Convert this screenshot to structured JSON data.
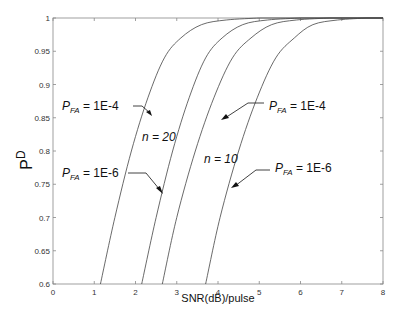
{
  "chart_data": {
    "type": "line",
    "title": "",
    "xlabel": "SNR(dB)/pulse",
    "ylabel": "P_D",
    "xlim": [
      0,
      8
    ],
    "ylim": [
      0.6,
      1
    ],
    "grid": false,
    "x_ticks": [
      "0",
      "1",
      "2",
      "3",
      "4",
      "5",
      "6",
      "7",
      "8"
    ],
    "y_ticks": [
      "0.6",
      "0.65",
      "0.7",
      "0.75",
      "0.8",
      "0.85",
      "0.9",
      "0.95",
      "1"
    ],
    "series": [
      {
        "name": "n = 20, P_FA = 1E-4",
        "x": [
          1.15,
          1.5,
          1.9,
          2.3,
          2.7,
          3.1,
          3.6,
          4.2,
          5.0
        ],
        "y": [
          0.6,
          0.7,
          0.8,
          0.88,
          0.94,
          0.97,
          0.99,
          0.997,
          1.0
        ]
      },
      {
        "name": "n = 20, P_FA = 1E-6",
        "x": [
          2.15,
          2.5,
          2.9,
          3.3,
          3.7,
          4.1,
          4.6,
          5.2,
          6.0
        ],
        "y": [
          0.6,
          0.7,
          0.8,
          0.88,
          0.94,
          0.97,
          0.99,
          0.997,
          1.0
        ]
      },
      {
        "name": "n = 10, P_FA = 1E-4",
        "x": [
          2.65,
          3.0,
          3.45,
          3.9,
          4.35,
          4.8,
          5.3,
          5.9,
          6.7
        ],
        "y": [
          0.6,
          0.7,
          0.8,
          0.88,
          0.94,
          0.97,
          0.99,
          0.997,
          1.0
        ]
      },
      {
        "name": "n = 10, P_FA = 1E-6",
        "x": [
          3.7,
          4.05,
          4.5,
          4.95,
          5.4,
          5.85,
          6.3,
          6.9,
          7.6
        ],
        "y": [
          0.6,
          0.7,
          0.8,
          0.88,
          0.94,
          0.97,
          0.99,
          0.997,
          1.0
        ]
      }
    ],
    "annotations": [
      {
        "text": "P_FA = 1E-4",
        "target": "n = 20, P_FA = 1E-4"
      },
      {
        "text": "P_FA = 1E-6",
        "target": "n = 20, P_FA = 1E-6"
      },
      {
        "text": "n = 20"
      },
      {
        "text": "P_FA = 1E-4",
        "target": "n = 10, P_FA = 1E-4"
      },
      {
        "text": "P_FA = 1E-6",
        "target": "n = 10, P_FA = 1E-6"
      },
      {
        "text": "n = 10"
      }
    ]
  },
  "labels": {
    "xlabel": "SNR(dB)/pulse",
    "ylabel_main": "P",
    "ylabel_sub": "D",
    "pfa_prefix": "P",
    "pfa_sub": "FA",
    "pfa_1e4": " = 1E-4",
    "pfa_1e6": " = 1E-6",
    "n20": "n = 20",
    "n10": "n = 10"
  }
}
